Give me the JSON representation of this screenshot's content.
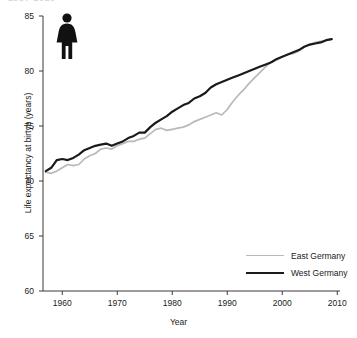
{
  "figure": {
    "clipped_title_fragment": "1957-2010",
    "pictogram_icon": "female-figure-icon"
  },
  "chart_data": {
    "type": "line",
    "title": "",
    "xlabel": "Year",
    "ylabel": "Life expectancy at birtyh (years)",
    "xlim": [
      1956.5,
      2010.5
    ],
    "ylim": [
      60,
      85
    ],
    "xticks": [
      1960,
      1970,
      1980,
      1990,
      2000,
      2010
    ],
    "yticks": [
      60,
      65,
      70,
      75,
      80,
      85
    ],
    "grid": false,
    "legend_position": "lower-right",
    "colors": {
      "east_germany": "#b9b9b9",
      "west_germany": "#1a1a1a",
      "axis": "#3a3a3a"
    },
    "x": [
      1957,
      1958,
      1959,
      1960,
      1961,
      1962,
      1963,
      1964,
      1965,
      1966,
      1967,
      1968,
      1969,
      1970,
      1971,
      1972,
      1973,
      1974,
      1975,
      1976,
      1977,
      1978,
      1979,
      1980,
      1981,
      1982,
      1983,
      1984,
      1985,
      1986,
      1987,
      1988,
      1989,
      1990,
      1991,
      1992,
      1993,
      1994,
      1995,
      1996,
      1997,
      1998,
      1999,
      2000,
      2001,
      2002,
      2003,
      2004,
      2005,
      2006,
      2007,
      2008,
      2009
    ],
    "series": [
      {
        "name": "East Germany",
        "values": [
          70.8,
          70.7,
          70.9,
          71.2,
          71.5,
          71.4,
          71.5,
          72.0,
          72.3,
          72.5,
          72.9,
          73.0,
          72.9,
          73.2,
          73.4,
          73.6,
          73.6,
          73.8,
          73.9,
          74.3,
          74.7,
          74.8,
          74.6,
          74.7,
          74.8,
          74.9,
          75.1,
          75.4,
          75.6,
          75.8,
          76.0,
          76.2,
          76.0,
          76.5,
          77.2,
          77.8,
          78.3,
          78.9,
          79.4,
          79.9,
          80.4,
          80.8,
          81.0,
          81.3,
          81.5,
          81.6,
          81.8,
          82.2,
          82.4,
          82.6,
          82.7,
          82.8,
          82.9
        ]
      },
      {
        "name": "West Germany",
        "values": [
          70.9,
          71.2,
          71.9,
          72.0,
          71.9,
          72.1,
          72.4,
          72.8,
          73.0,
          73.2,
          73.3,
          73.4,
          73.2,
          73.4,
          73.6,
          73.9,
          74.1,
          74.4,
          74.4,
          74.9,
          75.3,
          75.6,
          75.9,
          76.3,
          76.6,
          76.9,
          77.1,
          77.5,
          77.7,
          78.0,
          78.5,
          78.8,
          79.0,
          79.2,
          79.4,
          79.6,
          79.8,
          80.0,
          80.2,
          80.4,
          80.6,
          80.8,
          81.1,
          81.3,
          81.5,
          81.7,
          81.9,
          82.2,
          82.4,
          82.5,
          82.6,
          82.8,
          82.9
        ]
      }
    ]
  }
}
